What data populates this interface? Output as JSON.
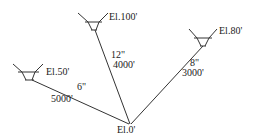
{
  "diagram": {
    "type": "three-reservoir pipe network",
    "colors": {
      "line": "#333333",
      "text": "#222222",
      "background": "#ffffff"
    },
    "reservoirs": [
      {
        "id": "A",
        "elevation_label": "El.100'"
      },
      {
        "id": "B",
        "elevation_label": "El.80'"
      },
      {
        "id": "C",
        "elevation_label": "El.50'"
      }
    ],
    "junction": {
      "elevation_label": "El.0'"
    },
    "pipes": [
      {
        "from": "A",
        "diameter": "12\"",
        "length": "4000'"
      },
      {
        "from": "B",
        "diameter": "8\"",
        "length": "3000'"
      },
      {
        "from": "C",
        "diameter": "6\"",
        "length": "5000'"
      }
    ]
  }
}
